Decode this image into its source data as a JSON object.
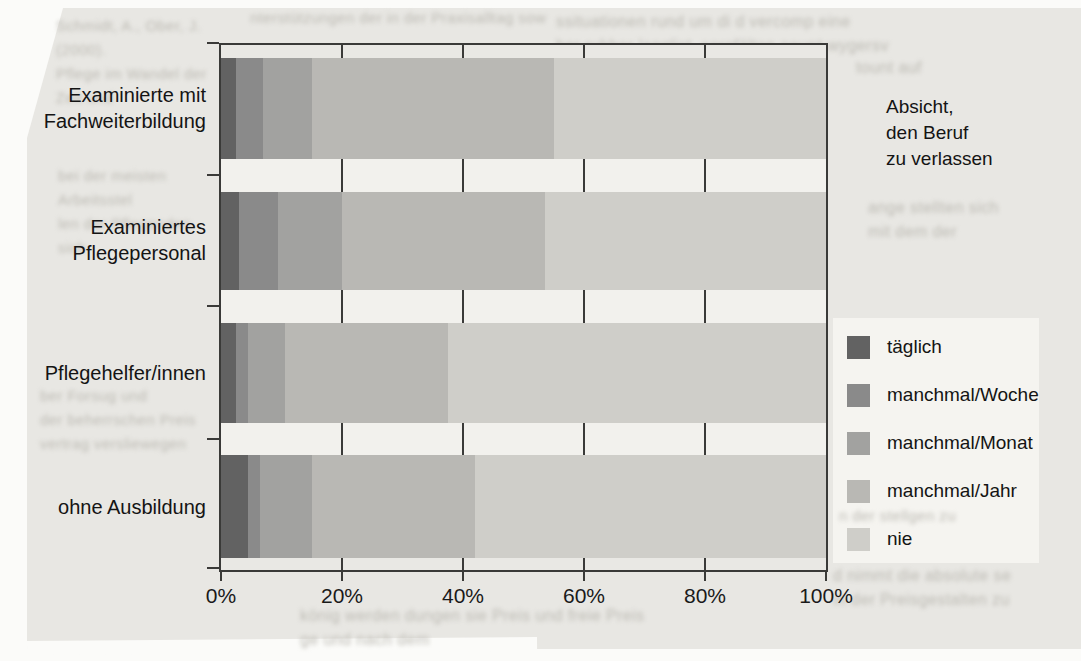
{
  "chart_data": {
    "type": "bar",
    "orientation": "horizontal",
    "stacked": true,
    "title": "Absicht, den Beruf zu verlassen",
    "categories": [
      "Examinierte mit Fachweiterbildung",
      "Examiniertes Pflegepersonal",
      "Pflegehelfer/innen",
      "ohne Ausbildung"
    ],
    "series": [
      {
        "name": "täglich",
        "color": "#626262",
        "values": [
          2.5,
          3.0,
          2.5,
          4.5
        ]
      },
      {
        "name": "manchmal/Woche",
        "color": "#8a8a8a",
        "values": [
          4.5,
          6.5,
          2.0,
          2.0
        ]
      },
      {
        "name": "manchmal/Monat",
        "color": "#a2a2a0",
        "values": [
          8.0,
          10.5,
          6.0,
          8.5
        ]
      },
      {
        "name": "manchmal/Jahr",
        "color": "#b9b8b4",
        "values": [
          40.0,
          33.5,
          27.0,
          27.0
        ]
      },
      {
        "name": "nie",
        "color": "#cfcec9",
        "values": [
          45.0,
          46.5,
          62.5,
          58.0
        ]
      }
    ],
    "x_tick_labels": [
      "0%",
      "20%",
      "40%",
      "60%",
      "80%",
      "100%"
    ],
    "xlim": [
      0,
      100
    ],
    "unit": "%",
    "grid": "vertical ticks at 20% steps",
    "legend_position": "right, below annotation"
  },
  "ui": {
    "category_labels": [
      "Examinierte mit\nFachweiterbildung",
      "Examiniertes\nPflegepersonal",
      "Pflegehelfer/innen",
      "ohne Ausbildung"
    ],
    "annotation": "Absicht,\nden Beruf\nzu verlassen",
    "colors": {
      "page_bg": "#e8e7e3",
      "row_gap_bg": "#f2f1ed",
      "legend_bg": "#f5f4f0",
      "frame": "#3a3a38",
      "text": "#141414"
    },
    "showthrough_fragments": [
      "Schmidt, A., Ober, J. (2000).\nPflege im Wandel der Zeit und",
      "nterstützungen der in der Praxisalltag sow",
      "ssituationen rund um di d vercomp eine\nber ruhber langlist, sorgfälten neunt wygersv",
      "tount auf",
      "bei der meisten Arbeitsstel\nlen der Pflegenden sich",
      "ber Forsug und\nder beherrschen Preis\nvertrag versliewegen",
      "könig werden dungen sie Preis und freie Preis\nge und nach dem",
      "d nimmt die absolute se\nin der Preisgestalten zu",
      "ange stellten sich\nmit dem der",
      "n der stellgen zu"
    ]
  }
}
